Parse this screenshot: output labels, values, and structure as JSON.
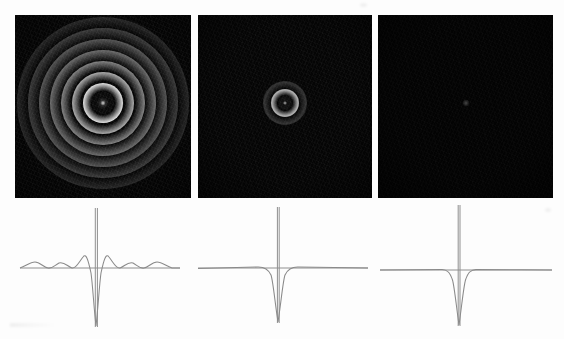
{
  "figure": {
    "title": "",
    "background_color": "#fdfdfd",
    "width": 564,
    "height": 339,
    "panel_background": "#050505",
    "trace_color": "#8a8a8a",
    "baseline_color": "#8f8f8f"
  },
  "panels": [
    {
      "id": "panel-a",
      "label": "",
      "x": 15,
      "y": 15,
      "w": 176,
      "h": 183,
      "description": "strong concentric diffraction rings, high contrast",
      "ring_count": 8,
      "core_radius": 9,
      "peak_brightness": "#f2f2f2",
      "center_dot": true
    },
    {
      "id": "panel-b",
      "label": "",
      "x": 198,
      "y": 15,
      "w": 174,
      "h": 183,
      "description": "single faint ring at center, mostly dark background noise",
      "ring_count": 2,
      "core_radius": 7,
      "peak_brightness": "#b9b9b9",
      "center_dot": true
    },
    {
      "id": "panel-c",
      "label": "",
      "x": 378,
      "y": 15,
      "w": 175,
      "h": 183,
      "description": "nearly uniform black field with a single faint central point",
      "ring_count": 0,
      "core_radius": 3,
      "peak_brightness": "#4a4a4a",
      "center_dot": true
    }
  ],
  "chart_data": {
    "type": "line",
    "title": "",
    "subtitle": "",
    "xlabel": "",
    "ylabel": "",
    "grid": false,
    "legend": false,
    "axis_ranges": {
      "x": [
        -1,
        1
      ],
      "y": [
        -1.0,
        1.0
      ]
    },
    "shared_features": {
      "baseline_value": 0,
      "spike_label": "central vertical spike",
      "spike_top_value": 1.0,
      "dip_label": "central negative dip"
    },
    "plots": [
      {
        "id": "trace-a",
        "panel": "panel-a",
        "x": 8,
        "y": 205,
        "w": 180,
        "h": 130,
        "baseline_y": 268,
        "spike_top_y": 208,
        "dip_bottom_y": 326,
        "sidelobes_per_side": 3,
        "sidelobe_amplitude": 0.085,
        "dip_half_width": 0.17,
        "series": [
          {
            "name": "radial profile A",
            "x": [
              -1.0,
              -0.92,
              -0.84,
              -0.76,
              -0.68,
              -0.6,
              -0.52,
              -0.44,
              -0.36,
              -0.28,
              -0.2,
              -0.13,
              -0.08,
              -0.04,
              0.0,
              0.04,
              0.08,
              0.13,
              0.2,
              0.28,
              0.36,
              0.44,
              0.52,
              0.6,
              0.68,
              0.76,
              0.84,
              0.92,
              1.0
            ],
            "y": [
              0.0,
              0.03,
              0.07,
              0.03,
              -0.01,
              0.02,
              0.08,
              0.03,
              -0.02,
              0.05,
              0.17,
              0.05,
              -0.4,
              -0.9,
              -1.0,
              -0.9,
              -0.4,
              0.05,
              0.17,
              0.05,
              -0.02,
              0.03,
              0.08,
              0.02,
              -0.01,
              0.03,
              0.07,
              0.03,
              0.0
            ]
          }
        ]
      },
      {
        "id": "trace-b",
        "panel": "panel-b",
        "x": 192,
        "y": 205,
        "w": 180,
        "h": 130,
        "baseline_y": 268,
        "spike_top_y": 208,
        "dip_bottom_y": 322,
        "sidelobes_per_side": 0,
        "sidelobe_amplitude": 0.01,
        "dip_half_width": 0.13,
        "series": [
          {
            "name": "radial profile B",
            "x": [
              -1.0,
              -0.8,
              -0.6,
              -0.4,
              -0.28,
              -0.2,
              -0.14,
              -0.09,
              -0.05,
              -0.02,
              0.0,
              0.02,
              0.05,
              0.09,
              0.14,
              0.2,
              0.28,
              0.4,
              0.6,
              0.8,
              1.0
            ],
            "y": [
              0.01,
              0.01,
              0.01,
              0.01,
              0.01,
              0.0,
              -0.05,
              -0.25,
              -0.62,
              -0.92,
              -1.0,
              -0.92,
              -0.62,
              -0.25,
              -0.05,
              0.0,
              0.01,
              0.01,
              0.01,
              0.01,
              0.01
            ]
          }
        ]
      },
      {
        "id": "trace-c",
        "panel": "panel-c",
        "x": 372,
        "y": 205,
        "w": 184,
        "h": 130,
        "baseline_y": 268,
        "spike_top_y": 205,
        "dip_bottom_y": 324,
        "sidelobes_per_side": 0,
        "sidelobe_amplitude": 0.005,
        "dip_half_width": 0.11,
        "series": [
          {
            "name": "radial profile C",
            "x": [
              -1.0,
              -0.8,
              -0.6,
              -0.4,
              -0.26,
              -0.18,
              -0.12,
              -0.08,
              -0.04,
              -0.015,
              0.0,
              0.015,
              0.04,
              0.08,
              0.12,
              0.18,
              0.26,
              0.4,
              0.6,
              0.8,
              1.0
            ],
            "y": [
              0.0,
              0.0,
              0.0,
              0.0,
              0.0,
              -0.01,
              -0.12,
              -0.42,
              -0.8,
              -0.97,
              -1.0,
              -0.97,
              -0.8,
              -0.42,
              -0.12,
              -0.01,
              0.0,
              0.0,
              0.0,
              0.0,
              0.0
            ]
          }
        ]
      }
    ]
  }
}
